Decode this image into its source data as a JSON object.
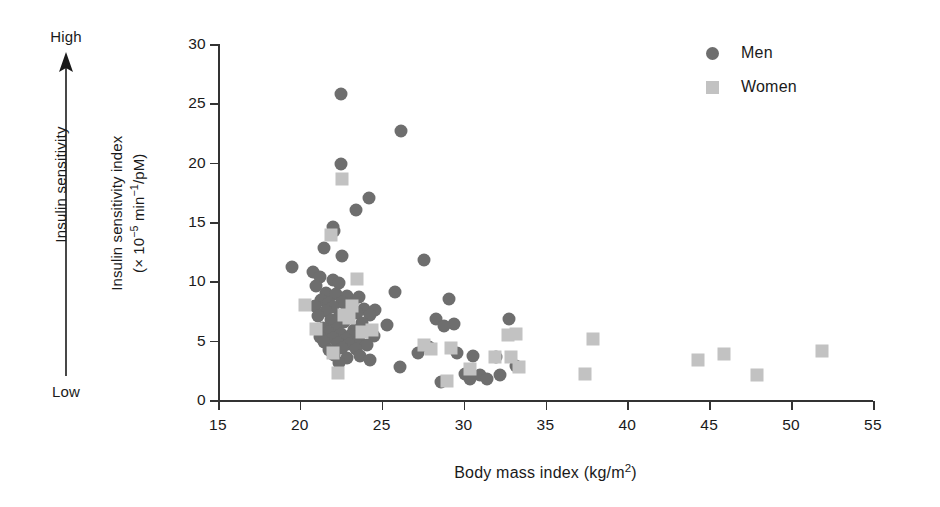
{
  "annotation": {
    "high_label": "High",
    "low_label": "Low",
    "caption": "Insulin sensitivity",
    "arrow_icon": "up-arrow-icon"
  },
  "legend": {
    "position": "top-right",
    "entries": [
      {
        "label": "Men",
        "marker": "circle",
        "color": "#6e6e6e"
      },
      {
        "label": "Women",
        "marker": "square",
        "color": "#c2c2c2"
      }
    ]
  },
  "axis": {
    "y_title_line1": "Insulin sensitivity index",
    "y_title_line2_pre": "(× 10",
    "y_title_line2_sup1": "−5",
    "y_title_line2_mid": " min",
    "y_title_line2_sup2": "−1",
    "y_title_line2_post": "/pM)",
    "x_title_pre": "Body mass index (kg/m",
    "x_title_sup": "2",
    "x_title_post": ")"
  },
  "chart_data": {
    "type": "scatter",
    "title": "",
    "xlabel": "Body mass index (kg/m2)",
    "ylabel": "Insulin sensitivity index (x 10-5 min-1/pM)",
    "xlim": [
      15,
      55
    ],
    "ylim": [
      0,
      30
    ],
    "xticks": [
      15,
      20,
      25,
      30,
      35,
      40,
      45,
      50,
      55
    ],
    "yticks": [
      0,
      5,
      10,
      15,
      20,
      25,
      30
    ],
    "grid": false,
    "legend_position": "top-right",
    "series": [
      {
        "name": "Men",
        "marker": "circle",
        "color": "#6e6e6e",
        "points": [
          [
            22.5,
            25.8
          ],
          [
            26.2,
            22.7
          ],
          [
            22.5,
            19.9
          ],
          [
            24.2,
            17.0
          ],
          [
            23.4,
            16.0
          ],
          [
            22.0,
            14.6
          ],
          [
            22.1,
            14.2
          ],
          [
            21.5,
            12.8
          ],
          [
            22.6,
            12.1
          ],
          [
            27.6,
            11.8
          ],
          [
            19.5,
            11.2
          ],
          [
            20.8,
            10.8
          ],
          [
            21.2,
            10.4
          ],
          [
            22.0,
            10.1
          ],
          [
            22.4,
            9.9
          ],
          [
            21.0,
            9.6
          ],
          [
            25.8,
            9.1
          ],
          [
            21.6,
            9.0
          ],
          [
            22.2,
            8.9
          ],
          [
            22.9,
            8.8
          ],
          [
            23.6,
            8.7
          ],
          [
            29.1,
            8.5
          ],
          [
            21.3,
            8.4
          ],
          [
            22.6,
            8.3
          ],
          [
            21.8,
            8.2
          ],
          [
            23.2,
            8.1
          ],
          [
            20.9,
            7.9
          ],
          [
            22.0,
            7.8
          ],
          [
            23.9,
            7.7
          ],
          [
            24.6,
            7.6
          ],
          [
            21.6,
            7.5
          ],
          [
            22.8,
            7.4
          ],
          [
            23.5,
            7.3
          ],
          [
            24.3,
            7.2
          ],
          [
            21.1,
            7.1
          ],
          [
            22.4,
            7.0
          ],
          [
            23.0,
            6.9
          ],
          [
            28.3,
            6.8
          ],
          [
            32.8,
            6.8
          ],
          [
            21.9,
            6.7
          ],
          [
            22.7,
            6.6
          ],
          [
            23.8,
            6.5
          ],
          [
            29.4,
            6.4
          ],
          [
            25.3,
            6.3
          ],
          [
            28.8,
            6.2
          ],
          [
            21.4,
            6.1
          ],
          [
            22.2,
            6.0
          ],
          [
            23.3,
            5.9
          ],
          [
            24.0,
            5.8
          ],
          [
            21.7,
            5.7
          ],
          [
            22.5,
            5.6
          ],
          [
            23.1,
            5.5
          ],
          [
            24.5,
            5.4
          ],
          [
            21.2,
            5.3
          ],
          [
            22.0,
            5.2
          ],
          [
            22.8,
            5.1
          ],
          [
            23.6,
            5.0
          ],
          [
            21.5,
            4.9
          ],
          [
            22.3,
            4.8
          ],
          [
            23.0,
            4.7
          ],
          [
            24.1,
            4.6
          ],
          [
            27.9,
            4.5
          ],
          [
            22.6,
            4.4
          ],
          [
            23.4,
            4.3
          ],
          [
            21.8,
            4.2
          ],
          [
            29.6,
            4.0
          ],
          [
            27.2,
            4.0
          ],
          [
            22.1,
            3.8
          ],
          [
            23.7,
            3.7
          ],
          [
            30.6,
            3.7
          ],
          [
            32.0,
            3.6
          ],
          [
            22.9,
            3.5
          ],
          [
            24.3,
            3.4
          ],
          [
            22.4,
            3.1
          ],
          [
            26.1,
            2.8
          ],
          [
            33.2,
            2.9
          ],
          [
            30.1,
            2.2
          ],
          [
            31.0,
            2.1
          ],
          [
            32.2,
            2.1
          ],
          [
            30.4,
            1.8
          ],
          [
            31.4,
            1.8
          ],
          [
            28.6,
            1.5
          ]
        ]
      },
      {
        "name": "Women",
        "marker": "square",
        "color": "#c2c2c2",
        "points": [
          [
            22.6,
            18.6
          ],
          [
            21.9,
            13.9
          ],
          [
            23.5,
            10.2
          ],
          [
            20.3,
            8.0
          ],
          [
            23.2,
            7.9
          ],
          [
            22.7,
            7.2
          ],
          [
            23.0,
            6.9
          ],
          [
            21.0,
            6.0
          ],
          [
            24.4,
            5.9
          ],
          [
            23.8,
            5.7
          ],
          [
            33.2,
            5.6
          ],
          [
            37.9,
            5.1
          ],
          [
            32.7,
            5.5
          ],
          [
            27.6,
            4.6
          ],
          [
            28.0,
            4.3
          ],
          [
            29.2,
            4.4
          ],
          [
            22.0,
            4.0
          ],
          [
            51.9,
            4.1
          ],
          [
            45.9,
            3.9
          ],
          [
            31.9,
            3.6
          ],
          [
            32.9,
            3.6
          ],
          [
            44.3,
            3.4
          ],
          [
            33.4,
            2.8
          ],
          [
            30.4,
            2.6
          ],
          [
            22.3,
            2.3
          ],
          [
            37.4,
            2.2
          ],
          [
            47.9,
            2.1
          ],
          [
            29.0,
            1.6
          ]
        ]
      }
    ]
  }
}
